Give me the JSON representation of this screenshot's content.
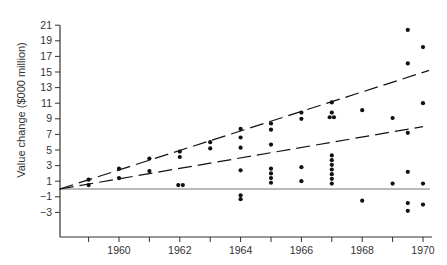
{
  "chart_data": {
    "type": "scatter",
    "title": "",
    "xlabel": "",
    "ylabel": "Value change ($000 million)",
    "xlim": [
      1958.05,
      1970.3
    ],
    "ylim": [
      -5,
      21
    ],
    "grid": false,
    "legend": null,
    "x_ticks": [
      1959,
      1960,
      1961,
      1962,
      1963,
      1964,
      1965,
      1966,
      1967,
      1968,
      1969,
      1970
    ],
    "x_tick_labels": [
      "",
      "1960",
      "",
      "1962",
      "",
      "1964",
      "",
      "1966",
      "",
      "1968",
      "",
      "1970"
    ],
    "y_ticks": [
      21,
      19,
      17,
      15,
      13,
      11,
      9,
      7,
      5,
      3,
      1,
      -1,
      -3
    ],
    "y_tick_labels": [
      "21",
      "19",
      "17",
      "15",
      "13",
      "11",
      "9",
      "7",
      "5",
      "3",
      "1",
      "−1",
      "−3"
    ],
    "zero_line": 0,
    "series": [
      {
        "name": "observations",
        "points": [
          [
            1959,
            1.2
          ],
          [
            1959,
            0.5
          ],
          [
            1960,
            2.6
          ],
          [
            1960,
            1.4
          ],
          [
            1961,
            3.9
          ],
          [
            1961,
            2.3
          ],
          [
            1962,
            4.8
          ],
          [
            1962,
            4.1
          ],
          [
            1961.95,
            0.5
          ],
          [
            1962.1,
            0.5
          ],
          [
            1963,
            6.0
          ],
          [
            1963,
            5.2
          ],
          [
            1964,
            7.7
          ],
          [
            1964,
            6.6
          ],
          [
            1964,
            5.3
          ],
          [
            1964,
            2.4
          ],
          [
            1964,
            -0.8
          ],
          [
            1964,
            -1.3
          ],
          [
            1965,
            8.4
          ],
          [
            1965,
            7.6
          ],
          [
            1965,
            5.7
          ],
          [
            1965,
            2.6
          ],
          [
            1965,
            2.0
          ],
          [
            1965,
            1.4
          ],
          [
            1965,
            0.8
          ],
          [
            1966,
            9.8
          ],
          [
            1966,
            9.0
          ],
          [
            1966,
            2.8
          ],
          [
            1966,
            1.0
          ],
          [
            1967,
            11.1
          ],
          [
            1967,
            9.8
          ],
          [
            1966.93,
            9.2
          ],
          [
            1967.07,
            9.2
          ],
          [
            1967,
            4.3
          ],
          [
            1967,
            3.7
          ],
          [
            1967,
            3.1
          ],
          [
            1967,
            2.5
          ],
          [
            1967,
            1.9
          ],
          [
            1967,
            1.3
          ],
          [
            1967,
            0.7
          ],
          [
            1968,
            10.1
          ],
          [
            1968,
            -1.5
          ],
          [
            1969,
            9.1
          ],
          [
            1969,
            0.7
          ],
          [
            1969.5,
            20.4
          ],
          [
            1969.5,
            16.1
          ],
          [
            1969.5,
            7.2
          ],
          [
            1969.5,
            2.2
          ],
          [
            1969.5,
            -1.8
          ],
          [
            1969.5,
            -2.8
          ],
          [
            1970,
            18.2
          ],
          [
            1970,
            11.0
          ],
          [
            1970,
            0.7
          ],
          [
            1970,
            -2.0
          ]
        ]
      }
    ],
    "trend_lines": [
      {
        "name": "upper-trend",
        "style": "dashed",
        "from": [
          1958.05,
          0
        ],
        "to": [
          1970.2,
          15.2
        ]
      },
      {
        "name": "lower-trend",
        "style": "dashed",
        "from": [
          1958.05,
          0
        ],
        "to": [
          1970.0,
          8.0
        ]
      }
    ]
  },
  "colors": {
    "ink": "#111111",
    "axis": "#333333",
    "baseline": "#777777"
  }
}
